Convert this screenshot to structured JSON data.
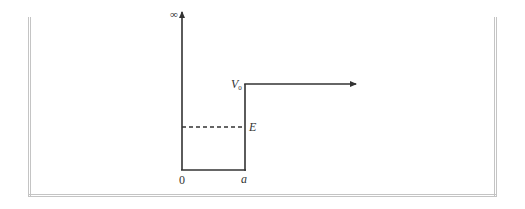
{
  "diagram": {
    "type": "potential-well",
    "labels": {
      "infinity": "∞",
      "V0_main": "V",
      "V0_sub": "0",
      "energy": "E",
      "origin": "0",
      "width": "a"
    },
    "colors": {
      "line": "#333333",
      "frame": "#c4c4c4",
      "background": "#ffffff"
    },
    "geometry": {
      "axis_x": 182,
      "axis_top": 10,
      "bottom_y": 170,
      "wall_x": 245,
      "v0_y": 84,
      "energy_y": 127,
      "arrow_end_x": 356
    }
  }
}
